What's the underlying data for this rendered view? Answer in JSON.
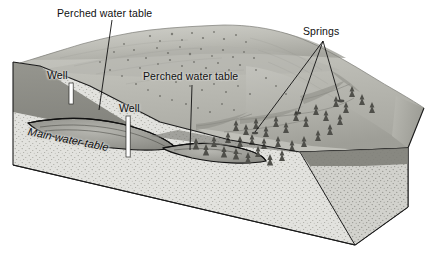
{
  "figure": {
    "type": "geologic-block-diagram",
    "width": 439,
    "height": 264,
    "background_color": "#ffffff"
  },
  "labels": {
    "perched_top": "Perched water table",
    "perched_mid": "Perched water table",
    "springs": "Springs",
    "well_left": "Well",
    "well_mid": "Well",
    "main_water_table": "Main water table"
  },
  "colors": {
    "ink": "#101010",
    "unsaturated_zone": "#8d8d8a",
    "saturated_zone": "#dcdcd8",
    "terrain_light": "#cfcfc9",
    "terrain_mid": "#b4b4ae",
    "terrain_dark": "#909089",
    "sky": "#ffffff",
    "well_casing": "#ffffff",
    "tree": "#4a4a46",
    "outline": "#1a1a1a"
  },
  "features": {
    "perched_lens_count": 2,
    "well_count": 2,
    "spring_count": 3,
    "spring_leader_targets": "three leader lines fan from the Springs label down to three seep points on the hillslope",
    "main_water_table_position": "boundary between dark unsaturated zone and light stippled saturated zone on the left cut face",
    "vegetation": "scattered conifers on the lower hillslopes and valley floor"
  }
}
